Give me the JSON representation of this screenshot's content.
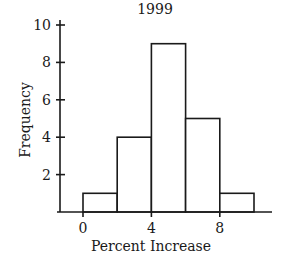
{
  "chart_data": {
    "type": "bar",
    "subtype": "histogram",
    "title": "1999",
    "xlabel": "Percent Increase",
    "ylabel": "Frequency",
    "bins": [
      {
        "start": 0,
        "end": 2,
        "count": 1
      },
      {
        "start": 2,
        "end": 4,
        "count": 4
      },
      {
        "start": 4,
        "end": 6,
        "count": 9
      },
      {
        "start": 6,
        "end": 8,
        "count": 5
      },
      {
        "start": 8,
        "end": 10,
        "count": 1
      }
    ],
    "categories": [
      "0-2",
      "2-4",
      "4-6",
      "6-8",
      "8-10"
    ],
    "values": [
      1,
      4,
      9,
      5,
      1
    ],
    "x_ticks": [
      0,
      4,
      8
    ],
    "y_ticks": [
      2,
      4,
      6,
      8,
      10
    ],
    "xlim": [
      -1.5,
      11
    ],
    "ylim": [
      0,
      10
    ],
    "grid": false,
    "legend": null
  },
  "colors": {
    "ink": "#1a1a1a",
    "bar_fill": "#ffffff",
    "background": "#ffffff"
  }
}
